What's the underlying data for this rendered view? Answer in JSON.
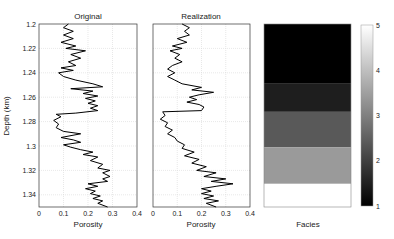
{
  "chart_data": [
    {
      "type": "line",
      "title": "Original",
      "xlabel": "Porosity",
      "ylabel": "Depth (km)",
      "xlim": [
        0,
        0.4
      ],
      "ylim": [
        1.35,
        1.2
      ],
      "y_inverted": true,
      "grid": true,
      "xticks": [
        "0",
        "0.1",
        "0.2",
        "0.3",
        "0.4"
      ],
      "yticks": [
        "1.2",
        "1.22",
        "1.24",
        "1.26",
        "1.28",
        "1.3",
        "1.32",
        "1.34"
      ],
      "series": [
        {
          "name": "Original porosity",
          "points": [
            [
              0.12,
              1.2
            ],
            [
              0.1,
              1.203
            ],
            [
              0.14,
              1.206
            ],
            [
              0.1,
              1.209
            ],
            [
              0.14,
              1.212
            ],
            [
              0.09,
              1.215
            ],
            [
              0.15,
              1.218
            ],
            [
              0.11,
              1.22
            ],
            [
              0.19,
              1.222
            ],
            [
              0.13,
              1.225
            ],
            [
              0.17,
              1.228
            ],
            [
              0.12,
              1.231
            ],
            [
              0.15,
              1.234
            ],
            [
              0.09,
              1.236
            ],
            [
              0.14,
              1.238
            ],
            [
              0.08,
              1.24
            ],
            [
              0.1,
              1.243
            ],
            [
              0.15,
              1.246
            ],
            [
              0.22,
              1.249
            ],
            [
              0.26,
              1.2515
            ],
            [
              0.13,
              1.253
            ],
            [
              0.22,
              1.255
            ],
            [
              0.18,
              1.257
            ],
            [
              0.24,
              1.259
            ],
            [
              0.19,
              1.261
            ],
            [
              0.23,
              1.263
            ],
            [
              0.2,
              1.265
            ],
            [
              0.24,
              1.267
            ],
            [
              0.21,
              1.269
            ],
            [
              0.24,
              1.271
            ],
            [
              0.15,
              1.273
            ],
            [
              0.07,
              1.274
            ],
            [
              0.09,
              1.276
            ],
            [
              0.06,
              1.279
            ],
            [
              0.08,
              1.282
            ],
            [
              0.07,
              1.285
            ],
            [
              0.1,
              1.288
            ],
            [
              0.17,
              1.29
            ],
            [
              0.09,
              1.293
            ],
            [
              0.14,
              1.295
            ],
            [
              0.17,
              1.297
            ],
            [
              0.1,
              1.299
            ],
            [
              0.13,
              1.301
            ],
            [
              0.17,
              1.303
            ],
            [
              0.22,
              1.305
            ],
            [
              0.18,
              1.307
            ],
            [
              0.24,
              1.309
            ],
            [
              0.21,
              1.312
            ],
            [
              0.26,
              1.315
            ],
            [
              0.24,
              1.318
            ],
            [
              0.29,
              1.32
            ],
            [
              0.26,
              1.322
            ],
            [
              0.29,
              1.325
            ],
            [
              0.26,
              1.327
            ],
            [
              0.28,
              1.329
            ],
            [
              0.2,
              1.331
            ],
            [
              0.24,
              1.333
            ],
            [
              0.19,
              1.335
            ],
            [
              0.23,
              1.337
            ],
            [
              0.21,
              1.339
            ],
            [
              0.25,
              1.341
            ],
            [
              0.22,
              1.343
            ],
            [
              0.26,
              1.345
            ],
            [
              0.24,
              1.347
            ],
            [
              0.28,
              1.35
            ]
          ]
        }
      ]
    },
    {
      "type": "line",
      "title": "Realization",
      "xlabel": "Porosity",
      "xlim": [
        0,
        0.4
      ],
      "ylim": [
        1.35,
        1.2
      ],
      "y_inverted": true,
      "grid": true,
      "xticks": [
        "0",
        "0.1",
        "0.2",
        "0.3",
        "0.4"
      ],
      "series": [
        {
          "name": "Realization porosity",
          "points": [
            [
              0.12,
              1.2
            ],
            [
              0.15,
              1.203
            ],
            [
              0.13,
              1.206
            ],
            [
              0.15,
              1.209
            ],
            [
              0.1,
              1.212
            ],
            [
              0.14,
              1.215
            ],
            [
              0.08,
              1.218
            ],
            [
              0.12,
              1.22
            ],
            [
              0.07,
              1.222
            ],
            [
              0.11,
              1.225
            ],
            [
              0.09,
              1.228
            ],
            [
              0.12,
              1.231
            ],
            [
              0.08,
              1.234
            ],
            [
              0.06,
              1.237
            ],
            [
              0.09,
              1.24
            ],
            [
              0.06,
              1.243
            ],
            [
              0.09,
              1.246
            ],
            [
              0.12,
              1.249
            ],
            [
              0.2,
              1.252
            ],
            [
              0.16,
              1.254
            ],
            [
              0.25,
              1.256
            ],
            [
              0.19,
              1.258
            ],
            [
              0.15,
              1.26
            ],
            [
              0.18,
              1.262
            ],
            [
              0.14,
              1.264
            ],
            [
              0.19,
              1.266
            ],
            [
              0.21,
              1.268
            ],
            [
              0.2,
              1.271
            ],
            [
              0.04,
              1.272
            ],
            [
              0.05,
              1.275
            ],
            [
              0.03,
              1.278
            ],
            [
              0.06,
              1.281
            ],
            [
              0.05,
              1.284
            ],
            [
              0.08,
              1.287
            ],
            [
              0.06,
              1.29
            ],
            [
              0.09,
              1.293
            ],
            [
              0.1,
              1.296
            ],
            [
              0.13,
              1.299
            ],
            [
              0.12,
              1.302
            ],
            [
              0.17,
              1.305
            ],
            [
              0.13,
              1.308
            ],
            [
              0.19,
              1.311
            ],
            [
              0.16,
              1.314
            ],
            [
              0.22,
              1.317
            ],
            [
              0.18,
              1.32
            ],
            [
              0.26,
              1.322
            ],
            [
              0.21,
              1.325
            ],
            [
              0.3,
              1.327
            ],
            [
              0.24,
              1.329
            ],
            [
              0.33,
              1.331
            ],
            [
              0.26,
              1.333
            ],
            [
              0.2,
              1.335
            ],
            [
              0.24,
              1.337
            ],
            [
              0.2,
              1.339
            ],
            [
              0.25,
              1.341
            ],
            [
              0.21,
              1.343
            ],
            [
              0.27,
              1.345
            ],
            [
              0.22,
              1.347
            ],
            [
              0.26,
              1.35
            ]
          ]
        }
      ]
    },
    {
      "type": "heatmap",
      "title": "",
      "xlabel": "Facies",
      "colormap": "gray",
      "clim": [
        1,
        5
      ],
      "colorbar_ticks": [
        "1",
        "2",
        "3",
        "4",
        "5"
      ],
      "bands": [
        {
          "from": 1.2,
          "to": 1.249,
          "value": 1,
          "color": "#000000"
        },
        {
          "from": 1.249,
          "to": 1.272,
          "value": 1.5,
          "color": "#1e1e1e"
        },
        {
          "from": 1.272,
          "to": 1.301,
          "value": 2.8,
          "color": "#595959"
        },
        {
          "from": 1.301,
          "to": 1.331,
          "value": 3.8,
          "color": "#9a9a9a"
        },
        {
          "from": 1.331,
          "to": 1.35,
          "value": 5,
          "color": "#ffffff"
        }
      ]
    }
  ],
  "labels": {
    "original_title": "Original",
    "realization_title": "Realization",
    "ylabel": "Depth (km)",
    "xlabel_original": "Porosity",
    "xlabel_realization": "Porosity",
    "xlabel_facies": "Facies"
  }
}
